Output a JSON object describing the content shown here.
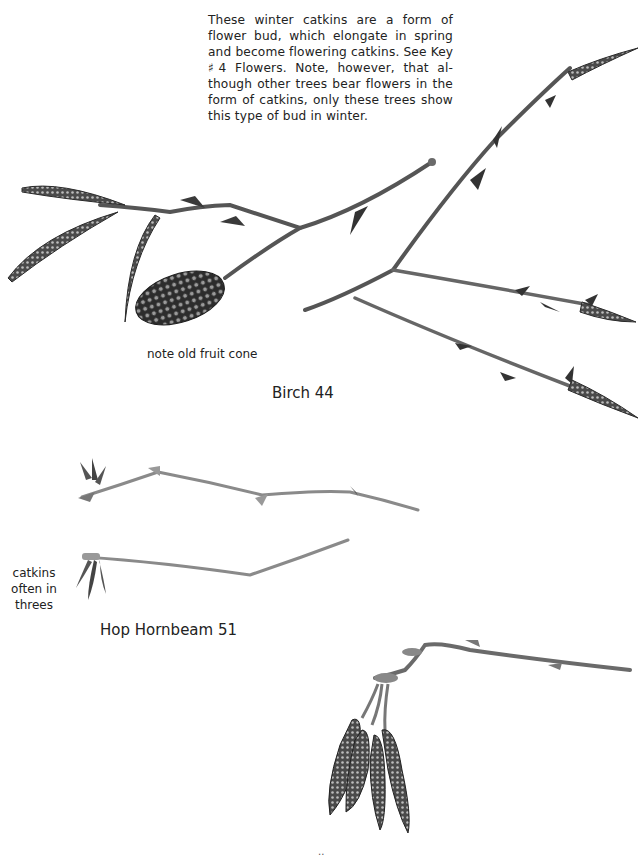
{
  "intro": {
    "lines": [
      "These winter catkins are a form of",
      "flower bud, which elongate in spring",
      "and become flowering catkins. See Key",
      "♯4 Flowers. Note, however, that al-",
      "though other trees bear flowers in the",
      "form of catkins, only these trees show",
      "this type of bud in winter."
    ]
  },
  "birch": {
    "note": "note old fruit cone",
    "label": "Birch 44"
  },
  "hop_hornbeam": {
    "note_lines": [
      "catkins",
      "often in",
      "threes"
    ],
    "label": "Hop Hornbeam 51"
  },
  "page_number": "..",
  "colors": {
    "ink": "#222222",
    "twig": "#5a5a5a",
    "twig_dark": "#2e2e2e",
    "catkin": "#3a3a3a",
    "background": "#ffffff"
  }
}
